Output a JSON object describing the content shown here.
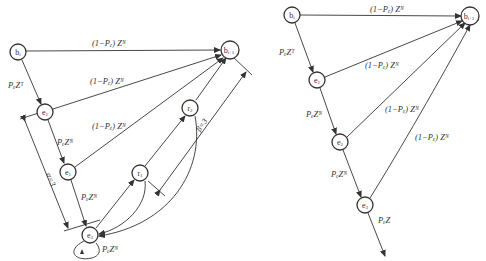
{
  "left_diagram": {
    "nodes": {
      "b_i": {
        "label": "b",
        "sub": "i"
      },
      "b_next": {
        "label": "b",
        "sub": "i+1"
      },
      "e1_top": {
        "label": "e",
        "sub": "1"
      },
      "e1_mid": {
        "label": "e",
        "sub": "1"
      },
      "e3": {
        "label": "e",
        "sub": "3"
      },
      "r1": {
        "label": "r",
        "sub": "1"
      },
      "r2": {
        "label": "r",
        "sub": "2"
      }
    },
    "edges": {
      "b_to_bnext": "(1−Pₑ) Zᴺ",
      "b_to_e1": "PₑZᵀ",
      "e1_to_bnext": "(1−Pₑ) Zᴺ",
      "e1_to_e1mid": "PₑZᴺ",
      "e1mid_to_bnext": "(1−Pₑ) Zᴺ",
      "e1mid_to_e3": "PₑZᴺ",
      "e3_self": "PₑZᴺ"
    },
    "annotations": {
      "alpha": "α=3",
      "beta": "β=3"
    }
  },
  "right_diagram": {
    "nodes": {
      "b_i": {
        "label": "b",
        "sub": "i"
      },
      "b_next": {
        "label": "b",
        "sub": "i+1"
      },
      "e1": {
        "label": "e",
        "sub": "1"
      },
      "e2": {
        "label": "e",
        "sub": "2"
      },
      "e3": {
        "label": "e",
        "sub": "3"
      }
    },
    "edges": {
      "b_to_bnext": "(1−Pₑ) Zᴺ",
      "b_to_e1": "PₑZᵀ",
      "e1_to_bnext": "(1−Pₑ) Zᴺ",
      "e1_to_e2": "PₑZᴺ",
      "e2_to_bnext": "(1−Pₑ) Zᴺ",
      "e2_to_e3": "PₑZᴺ",
      "e3_to_bnext": "(1−Pₑ) Zᴺ",
      "e3_out": "PₑZ"
    }
  }
}
